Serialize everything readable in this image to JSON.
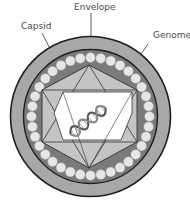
{
  "diagram": {
    "labels": {
      "envelope": "Envelope",
      "capsid": "Capsid",
      "genome": "Genome"
    },
    "colors": {
      "envelope": "#a8a8a8",
      "inner_band": "#7a7a7a",
      "beads": "#e6e6e6",
      "capsid_hexagon": "#c4c4c4",
      "core": "#ffffff",
      "outline": "#1e1e1e",
      "label_text": "#4a4a4a"
    },
    "bead_count": 36
  }
}
